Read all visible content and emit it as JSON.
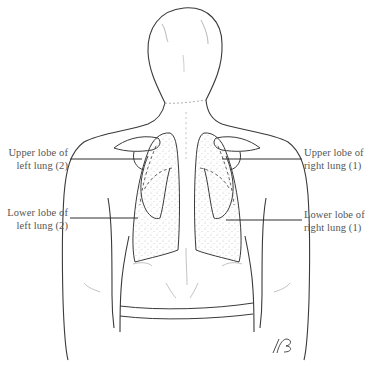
{
  "diagram": {
    "colors": {
      "outline": "#3a3a3a",
      "light_outline": "#9a9a9a",
      "lung_stipple": "#b9b9b9",
      "label_text": "#555555",
      "leader_line": "#2e2e2e"
    },
    "labels": [
      {
        "id": "upper-lobe-left",
        "side": "left",
        "line1": "Upper lobe of",
        "line2": "left lung (2)"
      },
      {
        "id": "lower-lobe-left",
        "side": "left",
        "line1": "Lower lobe of",
        "line2": "left lung (2)"
      },
      {
        "id": "upper-lobe-right",
        "side": "right",
        "line1": "Upper lobe of",
        "line2": "right lung (1)"
      },
      {
        "id": "lower-lobe-right",
        "side": "right",
        "line1": "Lower lobe of",
        "line2": "right lung (1)"
      }
    ],
    "signature": "/RB"
  }
}
